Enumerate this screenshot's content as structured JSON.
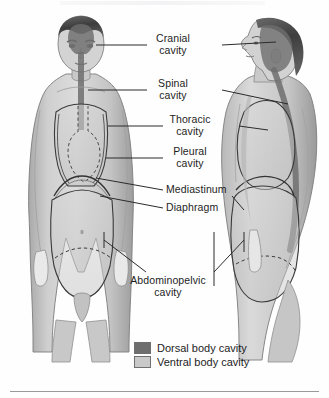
{
  "figure": {
    "title_clipped": "",
    "labels": [
      {
        "id": "cranial",
        "line1": "Cranial",
        "line2": "cavity"
      },
      {
        "id": "spinal",
        "line1": "Spinal",
        "line2": "cavity"
      },
      {
        "id": "thoracic",
        "line1": "Thoracic",
        "line2": "cavity"
      },
      {
        "id": "pleural",
        "line1": "Pleural",
        "line2": "cavity"
      },
      {
        "id": "mediastinum",
        "line1": "Mediastinum",
        "line2": ""
      },
      {
        "id": "diaphragm",
        "line1": "Diaphragm",
        "line2": ""
      },
      {
        "id": "abdominopelvic",
        "line1": "Abdominopelvic",
        "line2": "cavity"
      }
    ]
  },
  "legend": {
    "items": [
      {
        "label": "Dorsal body cavity",
        "swatch": "#6e6e6e"
      },
      {
        "label": "Ventral body cavity",
        "swatch": "#c9c9c9"
      }
    ]
  },
  "colors": {
    "dorsal": "#6e6e6e",
    "ventral": "#c9c9c9",
    "text": "#1d1d1d",
    "leader": "#2b2b2b",
    "skin_light": "#d8d8d8",
    "skin_mid": "#bdbdbd",
    "skin_dark": "#8f8f8f",
    "hair": "#4a4a4a",
    "rule": "#9a9a9a",
    "background": "#ffffff"
  }
}
